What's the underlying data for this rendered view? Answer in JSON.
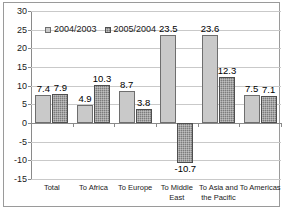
{
  "chart_data": {
    "type": "bar",
    "title": "",
    "subtitle": "",
    "xlabel": "",
    "ylabel": "",
    "ylim": [
      -15,
      30
    ],
    "ytick_step": 5,
    "yticks": [
      30,
      25,
      20,
      15,
      10,
      5,
      0,
      -5,
      -10,
      -15
    ],
    "ytick_labels": [
      "30",
      "25",
      "20",
      "15",
      "10",
      "5",
      "0",
      "-5",
      "-10",
      "-15"
    ],
    "grid": true,
    "grid_axis": "y",
    "legend_position": "upper-left-inside",
    "categories": [
      "Total",
      "To Africa",
      "To Europe",
      "To Middle\nEast",
      "To Asia and\nthe Pacific",
      "To Americas"
    ],
    "series": [
      {
        "name": "2004/2003",
        "color": "#c9c9c9",
        "values": [
          7.4,
          4.9,
          8.7,
          23.5,
          23.6,
          7.5
        ],
        "value_labels": [
          "7.4",
          "4.9",
          "8.7",
          "23.5",
          "23.6",
          "7.5"
        ]
      },
      {
        "name": "2005/2004",
        "color": "#7c7c7c",
        "values": [
          7.9,
          10.3,
          3.8,
          -10.7,
          12.3,
          7.1
        ],
        "value_labels": [
          "7.9",
          "10.3",
          "3.8",
          "-10.7",
          "12.3",
          "7.1"
        ]
      }
    ]
  }
}
